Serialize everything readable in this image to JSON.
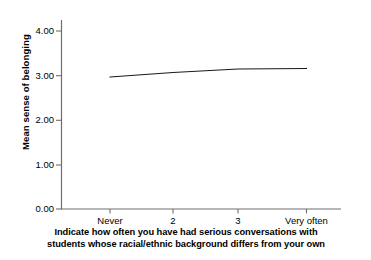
{
  "chart_data": {
    "type": "line",
    "title": "",
    "subtitle": "",
    "xlabel": "Indicate how often you have had serious conversations with students whose racial/ethnic background differs from your own",
    "xlabel_lines": [
      "Indicate how often you have had serious conversations with",
      "students whose racial/ethnic background differs from your own"
    ],
    "ylabel": "Mean sense of belonging",
    "categories": [
      "Never",
      "2",
      "3",
      "Very often"
    ],
    "xtick_labels": [
      "Never",
      "2",
      "3",
      "Very often"
    ],
    "ytick_labels": [
      "0.00",
      "1.00",
      "2.00",
      "3.00",
      "4.00"
    ],
    "ytick_values": [
      0.0,
      1.0,
      2.0,
      3.0,
      4.0
    ],
    "ylim": [
      0.0,
      4.25
    ],
    "grid": false,
    "legend": "none",
    "series": [
      {
        "name": "Mean sense of belonging",
        "color": "#1a1a1a",
        "values": [
          2.96,
          3.06,
          3.14,
          3.15
        ]
      }
    ]
  },
  "axes": {
    "y_title": "Mean sense of belonging",
    "y_ticks": [
      {
        "label": "4.00",
        "value": 4.0
      },
      {
        "label": "3.00",
        "value": 3.0
      },
      {
        "label": "2.00",
        "value": 2.0
      },
      {
        "label": "1.00",
        "value": 1.0
      },
      {
        "label": "0.00",
        "value": 0.0
      }
    ],
    "x_ticks": [
      {
        "label": "Never",
        "index": 0
      },
      {
        "label": "2",
        "index": 1
      },
      {
        "label": "3",
        "index": 2
      },
      {
        "label": "Very often",
        "index": 3
      }
    ]
  },
  "caption": {
    "line1": "Indicate how often you have had serious conversations with",
    "line2": "students whose racial/ethnic background differs from your own"
  },
  "colors": {
    "line": "#1a1a1a",
    "axis": "#6e6e6e",
    "text": "#000000",
    "background": "#ffffff"
  }
}
